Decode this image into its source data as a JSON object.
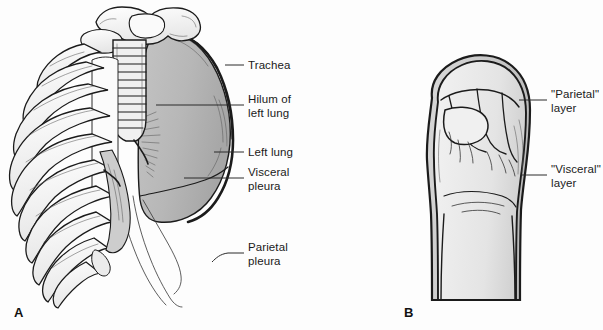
{
  "figure": {
    "background_color": "#fdfdfd",
    "ink_color": "#1b1b1b",
    "lung_fill_color": "#b9b9b9",
    "bone_fill_color": "#f4f4f4",
    "skin_fill_color": "#ededed",
    "outer_layer_fill_color": "#c9c9c9"
  },
  "panels": [
    {
      "letter": "A",
      "name": "thorax-rib-cage-lung",
      "description": "Anterolateral view of rib cage with left lung, trachea and pleura"
    },
    {
      "letter": "B",
      "name": "fist-analogy",
      "description": "Clenched fist pushed into a balloon analogy for pleural layers"
    }
  ],
  "labels_panel_a": [
    {
      "id": "trachea",
      "text": "Trachea",
      "lines": [
        "Trachea"
      ]
    },
    {
      "id": "hilum-of-left-lung",
      "text": "Hilum of left lung",
      "lines": [
        "Hilum of",
        "left lung"
      ]
    },
    {
      "id": "left-lung",
      "text": "Left lung",
      "lines": [
        "Left lung"
      ]
    },
    {
      "id": "visceral-pleura",
      "text": "Visceral pleura",
      "lines": [
        "Visceral",
        "pleura"
      ]
    },
    {
      "id": "parietal-pleura",
      "text": "Parietal pleura",
      "lines": [
        "Parietal",
        "pleura"
      ]
    }
  ],
  "labels_panel_b": [
    {
      "id": "parietal-layer",
      "text": "\"Parietal\" layer",
      "lines": [
        "\"Parietal\"",
        "layer"
      ]
    },
    {
      "id": "visceral-layer",
      "text": "\"Visceral\" layer",
      "lines": [
        "\"Visceral\"",
        "layer"
      ]
    }
  ]
}
